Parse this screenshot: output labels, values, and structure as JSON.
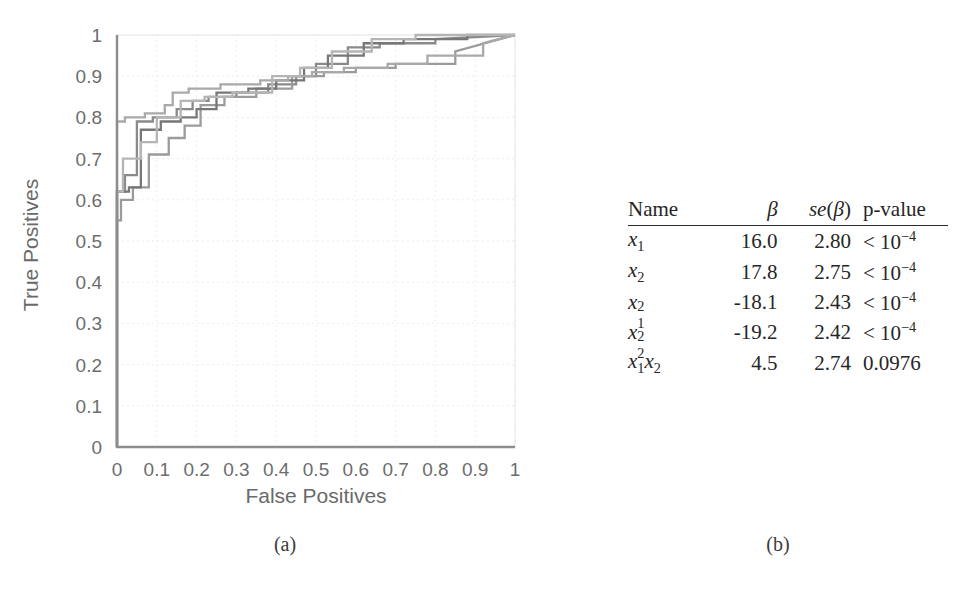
{
  "figure": {
    "caption_a": "(a)",
    "caption_b": "(b)"
  },
  "chart_data": {
    "type": "line",
    "title": "",
    "xlabel": "False Positives",
    "ylabel": "True Positives",
    "xlim": [
      0,
      1
    ],
    "ylim": [
      0,
      1
    ],
    "grid": true,
    "legend": "none",
    "xticks": [
      "0",
      "0.1",
      "0.2",
      "0.3",
      "0.4",
      "0.5",
      "0.6",
      "0.7",
      "0.8",
      "0.9",
      "1"
    ],
    "yticks": [
      "0",
      "0.1",
      "0.2",
      "0.3",
      "0.4",
      "0.5",
      "0.6",
      "0.7",
      "0.8",
      "0.9",
      "1"
    ],
    "series": [
      {
        "name": "roc-fold-1",
        "color": "#8a8a8a",
        "x": [
          0,
          0,
          0.02,
          0.02,
          0.05,
          0.05,
          0.09,
          0.09,
          0.15,
          0.15,
          0.19,
          0.19,
          0.23,
          0.23,
          0.3,
          0.3,
          0.38,
          0.38,
          0.45,
          0.45,
          0.5,
          0.5,
          0.58,
          0.58,
          0.66,
          0.66,
          0.8,
          0.8,
          1.0
        ],
        "y": [
          0,
          0.62,
          0.62,
          0.66,
          0.66,
          0.79,
          0.79,
          0.8,
          0.8,
          0.82,
          0.82,
          0.84,
          0.84,
          0.85,
          0.85,
          0.86,
          0.86,
          0.88,
          0.88,
          0.9,
          0.9,
          0.93,
          0.93,
          0.97,
          0.97,
          0.98,
          0.98,
          0.99,
          1.0
        ]
      },
      {
        "name": "roc-fold-2",
        "color": "#9b9b9b",
        "x": [
          0,
          0,
          0.01,
          0.01,
          0.04,
          0.04,
          0.08,
          0.08,
          0.13,
          0.13,
          0.17,
          0.17,
          0.21,
          0.21,
          0.27,
          0.27,
          0.35,
          0.35,
          0.44,
          0.44,
          0.52,
          0.52,
          0.6,
          0.6,
          0.7,
          0.7,
          0.85,
          0.85,
          1.0
        ],
        "y": [
          0,
          0.55,
          0.55,
          0.6,
          0.6,
          0.63,
          0.63,
          0.71,
          0.71,
          0.75,
          0.75,
          0.78,
          0.78,
          0.83,
          0.83,
          0.85,
          0.85,
          0.87,
          0.87,
          0.9,
          0.9,
          0.91,
          0.91,
          0.92,
          0.92,
          0.93,
          0.93,
          0.96,
          1.0
        ]
      },
      {
        "name": "roc-fold-3",
        "color": "#777777",
        "x": [
          0,
          0,
          0.03,
          0.03,
          0.06,
          0.06,
          0.11,
          0.11,
          0.16,
          0.16,
          0.2,
          0.2,
          0.25,
          0.25,
          0.33,
          0.33,
          0.4,
          0.4,
          0.47,
          0.47,
          0.53,
          0.53,
          0.62,
          0.62,
          0.72,
          0.72,
          0.88,
          0.88,
          1.0
        ],
        "y": [
          0,
          0.62,
          0.62,
          0.63,
          0.63,
          0.77,
          0.77,
          0.79,
          0.79,
          0.8,
          0.8,
          0.82,
          0.82,
          0.86,
          0.86,
          0.87,
          0.87,
          0.89,
          0.89,
          0.92,
          0.92,
          0.95,
          0.95,
          0.98,
          0.98,
          0.99,
          0.99,
          1.0,
          1.0
        ]
      },
      {
        "name": "roc-fold-4",
        "color": "#a9a9a9",
        "x": [
          0,
          0,
          0.02,
          0.02,
          0.07,
          0.07,
          0.12,
          0.12,
          0.14,
          0.14,
          0.18,
          0.18,
          0.26,
          0.26,
          0.36,
          0.36,
          0.43,
          0.43,
          0.49,
          0.49,
          0.57,
          0.57,
          0.68,
          0.68,
          0.78,
          0.78,
          0.92,
          0.92,
          1.0
        ],
        "y": [
          0,
          0.79,
          0.79,
          0.8,
          0.8,
          0.81,
          0.81,
          0.83,
          0.83,
          0.86,
          0.86,
          0.87,
          0.87,
          0.88,
          0.88,
          0.89,
          0.89,
          0.9,
          0.9,
          0.91,
          0.91,
          0.92,
          0.92,
          0.93,
          0.93,
          0.95,
          0.95,
          0.98,
          1.0
        ]
      },
      {
        "name": "roc-fold-5",
        "color": "#b5b5b5",
        "x": [
          0,
          0,
          0.015,
          0.015,
          0.06,
          0.06,
          0.1,
          0.1,
          0.16,
          0.16,
          0.22,
          0.22,
          0.29,
          0.29,
          0.39,
          0.39,
          0.46,
          0.46,
          0.54,
          0.54,
          0.64,
          0.64,
          0.75,
          0.75,
          0.9,
          0.9,
          1.0
        ],
        "y": [
          0,
          0.62,
          0.62,
          0.7,
          0.7,
          0.74,
          0.74,
          0.8,
          0.8,
          0.84,
          0.84,
          0.85,
          0.85,
          0.86,
          0.86,
          0.9,
          0.9,
          0.92,
          0.92,
          0.96,
          0.96,
          0.99,
          0.99,
          1.0,
          1.0,
          1.0,
          1.0
        ]
      }
    ]
  },
  "table": {
    "headers": {
      "name": "Name",
      "beta": "β",
      "se": "se(β)",
      "pvalue": "p-value"
    },
    "rows": [
      {
        "name": "x1",
        "beta": "16.0",
        "se": "2.80",
        "pvalue": "< 10⁻⁴"
      },
      {
        "name": "x2",
        "beta": "17.8",
        "se": "2.75",
        "pvalue": "< 10⁻⁴"
      },
      {
        "name": "x1^2",
        "beta": "-18.1",
        "se": "2.43",
        "pvalue": "< 10⁻⁴"
      },
      {
        "name": "x2^2",
        "beta": "-19.2",
        "se": "2.42",
        "pvalue": "< 10⁻⁴"
      },
      {
        "name": "x1x2",
        "beta": "4.5",
        "se": "2.74",
        "pvalue": "0.0976"
      }
    ]
  }
}
